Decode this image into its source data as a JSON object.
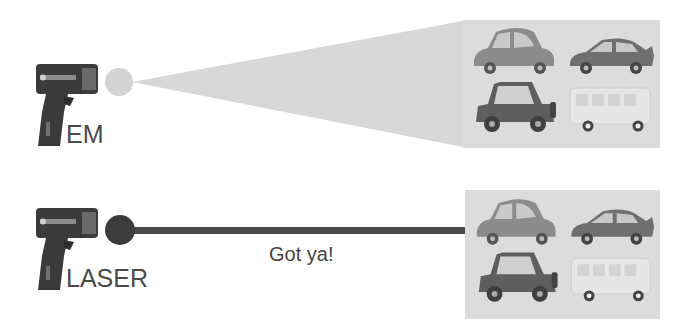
{
  "diagram": {
    "rows": [
      {
        "id": "em",
        "label": "EM",
        "beam_type": "cone",
        "beam_color": "#d6d6d6",
        "dot_color": "#d4d4d4",
        "caption": ""
      },
      {
        "id": "laser",
        "label": "LASER",
        "beam_type": "line",
        "beam_color": "#4a4a4a",
        "dot_color": "#3c3c3c",
        "caption": "Got ya!"
      }
    ],
    "vehicles": [
      "compact-car",
      "sports-car",
      "jeep",
      "minibus"
    ],
    "colors": {
      "gun_body": "#3a3a3a",
      "vehicle_panel": "#dcdcdc",
      "text": "#4a4a4a"
    }
  }
}
